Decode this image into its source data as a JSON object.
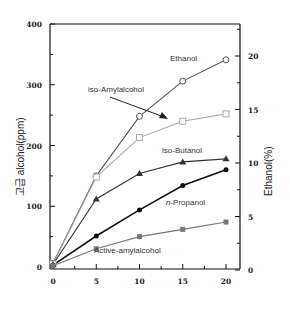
{
  "chart_data": {
    "type": "line",
    "title": "",
    "xlabel": "",
    "ylabel": "고급 alcohol(ppm)",
    "ylabel_right": "Ethanol(%)",
    "x": [
      0,
      5,
      10,
      15,
      20
    ],
    "xlim": [
      0,
      20
    ],
    "ylim": [
      0,
      400
    ],
    "ylim_right": [
      0,
      22.5
    ],
    "x_ticks": [
      "0",
      "5",
      "10",
      "15",
      "20"
    ],
    "y_ticks": [
      "0",
      "100",
      "200",
      "300",
      "400"
    ],
    "y_ticks_right": [
      "0",
      "5",
      "10",
      "15",
      "20"
    ],
    "grid": false,
    "legend": "inline labels",
    "series": [
      {
        "name": "Ethanol",
        "marker": "open-circle",
        "color": "#555555",
        "axis": "right",
        "values": [
          6,
          150,
          248,
          306,
          341
        ]
      },
      {
        "name": "iso-Amylalcohol",
        "marker": "open-square",
        "color": "#aaaaaa",
        "axis": "left",
        "values": [
          5,
          148,
          213,
          240,
          252
        ]
      },
      {
        "name": "iso-Butanol",
        "marker": "filled-triangle",
        "color": "#333333",
        "axis": "left",
        "values": [
          4,
          112,
          154,
          173,
          178
        ]
      },
      {
        "name": "n-Propanol",
        "marker": "filled-circle",
        "color": "#111111",
        "axis": "left",
        "values": [
          3,
          51,
          94,
          134,
          160
        ]
      },
      {
        "name": "Active-amylalcohol",
        "marker": "filled-square",
        "color": "#777777",
        "axis": "left",
        "values": [
          2,
          30,
          50,
          62,
          74
        ]
      }
    ],
    "annotations": [
      {
        "text": "Ethanol"
      },
      {
        "text": "iso-Amylalcohol",
        "arrow": true
      },
      {
        "text": "iso-Butanol"
      },
      {
        "text": "n-Propanol"
      },
      {
        "text": "Active-amylalcohol"
      }
    ]
  },
  "labels": {
    "ethanol": "Ethanol",
    "iso_amyl": "iso-Amylalcohol",
    "iso_butanol": "iso-Butanol",
    "n_prefix": "n",
    "n_propanol_rest": "-Propanol",
    "active_amyl": "Active-amylalcohol",
    "ylabel": "고급 alcohol(ppm)",
    "ylabel_right": "Ethanol(%)"
  }
}
